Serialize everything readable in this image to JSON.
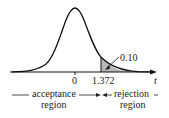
{
  "figure": {
    "type": "t-distribution one-tailed test diagram",
    "axis_variable": "t",
    "tick_labels": [
      "0",
      "1.372"
    ],
    "critical_value": "1.372",
    "tail_area_label": "0.10",
    "regions": {
      "acceptance": [
        "acceptance",
        "region"
      ],
      "rejection": [
        "rejection",
        "region"
      ]
    },
    "colors": {
      "curve": "#111111",
      "shade": "#b8b8b8",
      "text": "#222222"
    }
  }
}
